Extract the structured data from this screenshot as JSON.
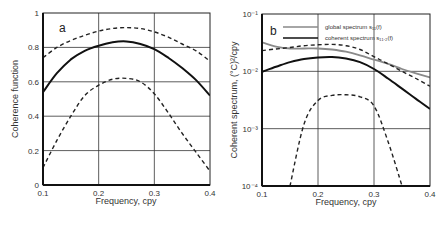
{
  "chart_data": [
    {
      "panel": "a",
      "type": "line",
      "xlabel": "Frequency, cpy",
      "ylabel": "Coherence function",
      "xlim": [
        0.1,
        0.4
      ],
      "ylim": [
        0,
        1
      ],
      "xticks": [
        "0.1",
        "0.2",
        "0.3",
        "0.4"
      ],
      "yticks": [
        "0",
        "0.2",
        "0.4",
        "0.6",
        "0.8",
        "1"
      ],
      "grid": true,
      "x": [
        0.1,
        0.125,
        0.15,
        0.175,
        0.2,
        0.225,
        0.25,
        0.275,
        0.3,
        0.325,
        0.35,
        0.375,
        0.4
      ],
      "series": [
        {
          "name": "coherence",
          "style": "solid",
          "values": [
            0.54,
            0.65,
            0.73,
            0.78,
            0.81,
            0.83,
            0.835,
            0.82,
            0.79,
            0.74,
            0.68,
            0.61,
            0.52
          ]
        },
        {
          "name": "upper bound",
          "style": "dashed",
          "values": [
            0.74,
            0.8,
            0.84,
            0.87,
            0.895,
            0.91,
            0.915,
            0.91,
            0.89,
            0.86,
            0.82,
            0.78,
            0.72
          ]
        },
        {
          "name": "lower bound",
          "style": "dashed",
          "values": [
            0.1,
            0.26,
            0.4,
            0.52,
            0.58,
            0.615,
            0.62,
            0.6,
            0.53,
            0.42,
            0.3,
            0.19,
            0.08
          ]
        }
      ]
    },
    {
      "panel": "b",
      "type": "line",
      "xlabel": "Frequency, cpy",
      "ylabel": "Coherent spectrum, (°C)²/cpy",
      "xlim": [
        0.1,
        0.4
      ],
      "ylim": [
        0.0001,
        0.1
      ],
      "yscale": "log",
      "xticks": [
        "0.1",
        "0.2",
        "0.3",
        "0.4"
      ],
      "yticks": [
        "10⁻⁴",
        "10⁻³",
        "10⁻²",
        "10⁻¹"
      ],
      "grid": true,
      "legend": [
        "global spectrum s₁₁(f)",
        "coherent spectrum s₁₁.₂(f)"
      ],
      "x": [
        0.1,
        0.125,
        0.15,
        0.175,
        0.2,
        0.225,
        0.25,
        0.275,
        0.3,
        0.325,
        0.35,
        0.375,
        0.4
      ],
      "series": [
        {
          "name": "global spectrum s11(f)",
          "style": "solid-gray",
          "values": [
            0.032,
            0.027,
            0.025,
            0.025,
            0.025,
            0.024,
            0.022,
            0.019,
            0.016,
            0.0135,
            0.011,
            0.0092,
            0.0078
          ]
        },
        {
          "name": "coherent spectrum s11.2(f)",
          "style": "solid",
          "values": [
            0.0098,
            0.012,
            0.0145,
            0.0165,
            0.0175,
            0.0178,
            0.0168,
            0.0145,
            0.011,
            0.0075,
            0.005,
            0.0033,
            0.0022
          ]
        },
        {
          "name": "upper bound",
          "style": "dashed",
          "values": [
            0.023,
            0.0245,
            0.026,
            0.028,
            0.029,
            0.0295,
            0.028,
            0.024,
            0.018,
            0.0135,
            0.01,
            0.0075,
            0.0055
          ]
        },
        {
          "name": "lower bound",
          "style": "dashed",
          "values": [
            null,
            null,
            0.0001,
            0.0012,
            0.0031,
            0.0038,
            0.0039,
            0.0036,
            0.0025,
            0.0006,
            0.0001,
            null,
            null
          ]
        }
      ]
    }
  ],
  "panels": {
    "a": {
      "letter": "a",
      "xlabel": "Frequency, cpy",
      "ylabel": "Coherence function"
    },
    "b": {
      "letter": "b",
      "xlabel": "Frequency, cpy",
      "ylabel": "Coherent spectrum, (°C)²/cpy",
      "legend": [
        {
          "label": "global spectrum s₁₁(f)",
          "color": "#888888"
        },
        {
          "label": "coherent spectrum s₁₁.₂(f)",
          "color": "#111111"
        }
      ]
    }
  }
}
